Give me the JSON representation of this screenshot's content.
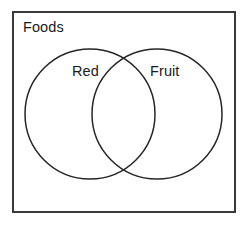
{
  "diagram": {
    "type": "venn",
    "title": "",
    "universe": {
      "label": "Foods",
      "border_color": "#3a3a3c",
      "background": "#ffffff"
    },
    "sets": [
      {
        "id": "left",
        "label": "Red",
        "cx": 90,
        "cy": 114,
        "r": 65,
        "stroke_color": "#262628",
        "fill": "none"
      },
      {
        "id": "right",
        "label": "Fruit",
        "cx": 157,
        "cy": 114,
        "r": 65,
        "stroke_color": "#262628",
        "fill": "none"
      }
    ],
    "regions": [
      {
        "name": "left-only",
        "label": ""
      },
      {
        "name": "intersection",
        "label": ""
      },
      {
        "name": "right-only",
        "label": ""
      },
      {
        "name": "outside",
        "label": ""
      }
    ],
    "text_color": "#1b1b1d",
    "canvas": {
      "width": 247,
      "height": 228
    }
  }
}
